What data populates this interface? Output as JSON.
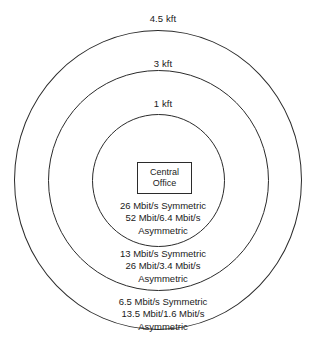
{
  "diagram": {
    "center_node": {
      "line1": "Central",
      "line2": "Office"
    },
    "rings": [
      {
        "id": "inner",
        "distance_label": "1 kft",
        "rates": [
          "26 Mbit/s Symmetric",
          "52 Mbit/6.4 Mbit/s",
          "Asymmetric"
        ]
      },
      {
        "id": "middle",
        "distance_label": "3 kft",
        "rates": [
          "13 Mbit/s Symmetric",
          "26 Mbit/3.4 Mbit/s",
          "Asymmetric"
        ]
      },
      {
        "id": "outer",
        "distance_label": "4.5 kft",
        "rates": [
          "6.5 Mbit/s Symmetric",
          "13.5 Mbit/1.6 Mbit/s",
          "Asymmetric"
        ]
      }
    ],
    "colors": {
      "background": "#ffffff",
      "stroke": "#2b2b2b",
      "text": "#1a1a1a"
    }
  }
}
